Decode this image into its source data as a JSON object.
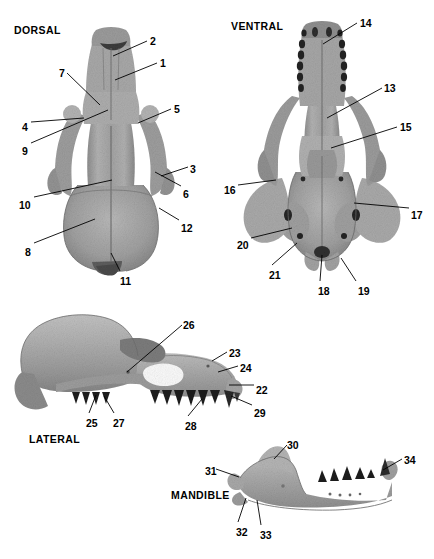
{
  "figure": {
    "background_color": "#ffffff",
    "bone_color": "#a6a6a6",
    "line_color": "#000000",
    "caption": ""
  },
  "views": [
    {
      "id": "dorsal",
      "label": "DORSAL",
      "x": 14,
      "y": 24
    },
    {
      "id": "ventral",
      "label": "VENTRAL",
      "x": 231,
      "y": 20
    },
    {
      "id": "lateral",
      "label": "LATERAL",
      "x": 29,
      "y": 433
    },
    {
      "id": "mandible",
      "label": "MANDIBLE",
      "x": 171,
      "y": 489
    }
  ],
  "labels": {
    "dorsal": [
      {
        "n": "2",
        "tx": 150,
        "ty": 36,
        "lx1": 147,
        "ly1": 41,
        "lx2": 113,
        "ly2": 56
      },
      {
        "n": "1",
        "tx": 160,
        "ty": 58,
        "lx1": 157,
        "ly1": 63,
        "lx2": 115,
        "ly2": 80
      },
      {
        "n": "7",
        "tx": 59,
        "ty": 68,
        "lx1": 67,
        "ly1": 73,
        "lx2": 100,
        "ly2": 105
      },
      {
        "n": "5",
        "tx": 174,
        "ty": 104,
        "lx1": 171,
        "ly1": 109,
        "lx2": 138,
        "ly2": 123
      },
      {
        "n": "4",
        "tx": 22,
        "ty": 122,
        "lx1": 31,
        "ly1": 122,
        "lx2": 84,
        "ly2": 118
      },
      {
        "n": "9",
        "tx": 22,
        "ty": 146,
        "lx1": 31,
        "ly1": 143,
        "lx2": 108,
        "ly2": 110
      },
      {
        "n": "3",
        "tx": 190,
        "ty": 164,
        "lx1": 188,
        "ly1": 167,
        "lx2": 161,
        "ly2": 176
      },
      {
        "n": "6",
        "tx": 183,
        "ty": 189,
        "lx1": 181,
        "ly1": 186,
        "lx2": 155,
        "ly2": 172
      },
      {
        "n": "10",
        "tx": 19,
        "ty": 200,
        "lx1": 34,
        "ly1": 197,
        "lx2": 112,
        "ly2": 180
      },
      {
        "n": "12",
        "tx": 181,
        "ty": 223,
        "lx1": 179,
        "ly1": 220,
        "lx2": 159,
        "ly2": 208
      },
      {
        "n": "8",
        "tx": 25,
        "ty": 247,
        "lx1": 34,
        "ly1": 243,
        "lx2": 95,
        "ly2": 219
      },
      {
        "n": "11",
        "tx": 120,
        "ty": 276,
        "lx1": 120,
        "ly1": 271,
        "lx2": 111,
        "ly2": 253
      }
    ],
    "ventral": [
      {
        "n": "14",
        "tx": 360,
        "ty": 18,
        "lx1": 357,
        "ly1": 23,
        "lx2": 323,
        "ly2": 44
      },
      {
        "n": "13",
        "tx": 384,
        "ty": 83,
        "lx1": 382,
        "ly1": 88,
        "lx2": 327,
        "ly2": 118
      },
      {
        "n": "15",
        "tx": 400,
        "ty": 122,
        "lx1": 397,
        "ly1": 127,
        "lx2": 331,
        "ly2": 148
      },
      {
        "n": "16",
        "tx": 224,
        "ty": 185,
        "lx1": 238,
        "ly1": 185,
        "lx2": 276,
        "ly2": 180
      },
      {
        "n": "17",
        "tx": 411,
        "ty": 210,
        "lx1": 409,
        "ly1": 208,
        "lx2": 354,
        "ly2": 203
      },
      {
        "n": "20",
        "tx": 237,
        "ty": 240,
        "lx1": 251,
        "ly1": 238,
        "lx2": 292,
        "ly2": 228
      },
      {
        "n": "21",
        "tx": 269,
        "ty": 270,
        "lx1": 272,
        "ly1": 265,
        "lx2": 297,
        "ly2": 243
      },
      {
        "n": "18",
        "tx": 318,
        "ty": 286,
        "lx1": 320,
        "ly1": 281,
        "lx2": 322,
        "ly2": 255
      },
      {
        "n": "19",
        "tx": 358,
        "ty": 286,
        "lx1": 356,
        "ly1": 281,
        "lx2": 341,
        "ly2": 258
      }
    ],
    "lateral": [
      {
        "n": "26",
        "tx": 183,
        "ty": 320,
        "lx1": 182,
        "ly1": 325,
        "lx2": 127,
        "ly2": 372
      },
      {
        "n": "23",
        "tx": 229,
        "ty": 348,
        "lx1": 227,
        "ly1": 352,
        "lx2": 212,
        "ly2": 361
      },
      {
        "n": "24",
        "tx": 240,
        "ty": 363,
        "lx1": 238,
        "ly1": 366,
        "lx2": 218,
        "ly2": 372
      },
      {
        "n": "22",
        "tx": 256,
        "ty": 385,
        "lx1": 254,
        "ly1": 385,
        "lx2": 229,
        "ly2": 385
      },
      {
        "n": "29",
        "tx": 254,
        "ty": 408,
        "lx1": 252,
        "ly1": 405,
        "lx2": 231,
        "ly2": 396
      },
      {
        "n": "25",
        "tx": 86,
        "ty": 418,
        "lx1": 89,
        "ly1": 413,
        "lx2": 96,
        "ly2": 395
      },
      {
        "n": "27",
        "tx": 113,
        "ty": 418,
        "lx1": 114,
        "ly1": 413,
        "lx2": 104,
        "ly2": 396
      },
      {
        "n": "28",
        "tx": 185,
        "ty": 421,
        "lx1": 188,
        "ly1": 416,
        "lx2": 202,
        "ly2": 399
      }
    ],
    "mandible": [
      {
        "n": "30",
        "tx": 287,
        "ty": 440,
        "lx1": 287,
        "ly1": 445,
        "lx2": 274,
        "ly2": 459
      },
      {
        "n": "34",
        "tx": 404,
        "ty": 455,
        "lx1": 402,
        "ly1": 459,
        "lx2": 383,
        "ly2": 470
      },
      {
        "n": "31",
        "tx": 205,
        "ty": 466,
        "lx1": 216,
        "ly1": 469,
        "lx2": 239,
        "ly2": 477
      },
      {
        "n": "32",
        "tx": 236,
        "ty": 527,
        "lx1": 238,
        "ly1": 522,
        "lx2": 246,
        "ly2": 498
      },
      {
        "n": "33",
        "tx": 260,
        "ty": 530,
        "lx1": 261,
        "ly1": 525,
        "lx2": 257,
        "ly2": 500
      }
    ]
  }
}
